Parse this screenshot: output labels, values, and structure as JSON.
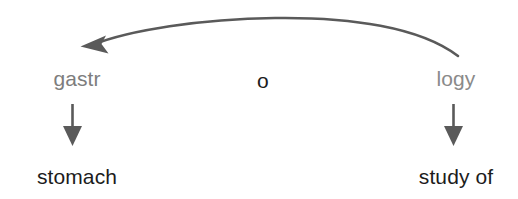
{
  "diagram": {
    "background_color": "#ffffff",
    "word_parts": [
      {
        "id": "prefix",
        "text": "gastr",
        "color": "#7d7d7d"
      },
      {
        "id": "combining_vowel",
        "text": "o",
        "color": "#1c1c1c"
      },
      {
        "id": "suffix",
        "text": "logy",
        "color": "#8a8a8a"
      }
    ],
    "meanings": [
      {
        "id": "prefix_meaning",
        "text": "stomach",
        "color": "#1c1c1c"
      },
      {
        "id": "suffix_meaning",
        "text": "study of",
        "color": "#1c1c1c"
      }
    ],
    "connectors": {
      "curved_arrow": {
        "name": "suffix-to-prefix-arc",
        "direction": "right-to-left",
        "color": "#5a5a5a"
      },
      "down_arrows": [
        {
          "name": "prefix-down-arrow",
          "color": "#5a5a5a"
        },
        {
          "name": "suffix-down-arrow",
          "color": "#5a5a5a"
        }
      ]
    }
  }
}
